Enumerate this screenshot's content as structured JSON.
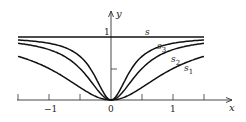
{
  "chart_data": {
    "type": "line",
    "title": "",
    "xlabel": "x",
    "ylabel": "y",
    "xlim": [
      -1.5,
      1.5
    ],
    "ylim": [
      0,
      1
    ],
    "x_tick_labels": [
      "-1",
      "0",
      "1"
    ],
    "x_ticks": [
      -1.5,
      -1,
      -0.5,
      0,
      0.5,
      1,
      1.5
    ],
    "y_tick_labels": [
      "1"
    ],
    "y_ticks": [
      0.5,
      1
    ],
    "grid": false,
    "series": [
      {
        "name": "s",
        "formula": "1",
        "x": [
          -1.5,
          0,
          1.5
        ],
        "values": [
          1,
          1,
          1
        ]
      },
      {
        "name": "s3",
        "formula": "9x^2/(1+9x^2)",
        "x": [
          -1.5,
          -1,
          -0.5,
          0,
          0.5,
          1,
          1.5
        ],
        "values": [
          0.95,
          0.9,
          0.69,
          0,
          0.69,
          0.9,
          0.95
        ]
      },
      {
        "name": "s2",
        "formula": "4x^2/(1+4x^2)",
        "x": [
          -1.5,
          -1,
          -0.5,
          0,
          0.5,
          1,
          1.5
        ],
        "values": [
          0.9,
          0.8,
          0.5,
          0,
          0.5,
          0.8,
          0.9
        ]
      },
      {
        "name": "s1",
        "formula": "x^2/(1+x^2)",
        "x": [
          -1.5,
          -1,
          -0.5,
          0,
          0.5,
          1,
          1.5
        ],
        "values": [
          0.69,
          0.5,
          0.2,
          0,
          0.2,
          0.5,
          0.69
        ]
      }
    ],
    "annotations": [
      {
        "text": "s",
        "near": "line y=1"
      },
      {
        "text": "s3",
        "near": "upper curve"
      },
      {
        "text": "s2",
        "near": "middle curve"
      },
      {
        "text": "s1",
        "near": "lower curve"
      }
    ]
  },
  "labels": {
    "x_axis": "x",
    "y_axis": "y",
    "y_one": "1",
    "x_minus_one": "−1",
    "x_zero": "0",
    "x_one": "1",
    "s": "s",
    "s3_base": "s",
    "s3_sub": "3",
    "s2_base": "s",
    "s2_sub": "2",
    "s1_base": "s",
    "s1_sub": "1"
  }
}
